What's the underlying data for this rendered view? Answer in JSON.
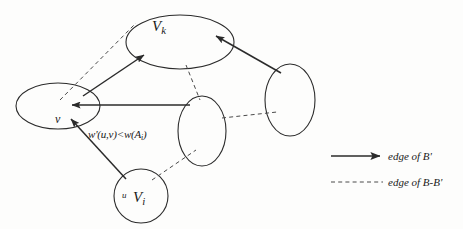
{
  "figure": {
    "nodes": [
      {
        "id": "vk",
        "label_main": "V",
        "label_sub": "k",
        "shape": "ellipse",
        "cx": 180,
        "cy": 42,
        "rx": 54,
        "ry": 27,
        "orientation": "horizontal"
      },
      {
        "id": "v",
        "label_main": "v",
        "label_sub": "",
        "shape": "ellipse",
        "cx": 58,
        "cy": 106,
        "rx": 42,
        "ry": 23,
        "orientation": "horizontal"
      },
      {
        "id": "mid",
        "label_main": "",
        "label_sub": "",
        "shape": "ellipse",
        "cx": 202,
        "cy": 131,
        "rx": 24,
        "ry": 35,
        "orientation": "vertical"
      },
      {
        "id": "right",
        "label_main": "",
        "label_sub": "",
        "shape": "ellipse",
        "cx": 290,
        "cy": 100,
        "rx": 25,
        "ry": 36,
        "orientation": "vertical"
      },
      {
        "id": "vi",
        "label_main": "V",
        "label_sub": "i",
        "shape": "circle",
        "cx": 141,
        "cy": 196,
        "rx": 27,
        "ry": 27,
        "orientation": "circle"
      }
    ],
    "node_labels": {
      "vk": "V",
      "vk_sub": "k",
      "v": "v",
      "vi": "V",
      "vi_sub": "i",
      "u": "u"
    },
    "edges_solid": [
      {
        "name": "v-to-vk",
        "from": "v",
        "to": "vk",
        "x1": 83,
        "y1": 96,
        "x2": 144,
        "y2": 55
      },
      {
        "name": "mid-to-v",
        "from": "mid",
        "to": "v",
        "x1": 190,
        "y1": 105,
        "x2": 72,
        "y2": 105
      },
      {
        "name": "vi-to-v",
        "from": "vi",
        "to": "v",
        "x1": 126,
        "y1": 179,
        "x2": 71,
        "y2": 119
      },
      {
        "name": "right-to-vk",
        "from": "right",
        "to": "vk",
        "x1": 281,
        "y1": 73,
        "x2": 216,
        "y2": 36
      }
    ],
    "edges_dashed": [
      {
        "name": "v-to-vk-dashed",
        "from": "v",
        "to": "vk",
        "x1": 60,
        "y1": 100,
        "x2": 136,
        "y2": 23
      },
      {
        "name": "vk-to-mid-dashed",
        "from": "vk",
        "to": "mid",
        "x1": 186,
        "y1": 65,
        "x2": 200,
        "y2": 100
      },
      {
        "name": "mid-to-right-dashed",
        "from": "mid",
        "to": "right",
        "x1": 222,
        "y1": 118,
        "x2": 277,
        "y2": 112
      },
      {
        "name": "vi-to-mid-dashed",
        "from": "vi",
        "to": "mid",
        "x1": 152,
        "y1": 180,
        "x2": 196,
        "y2": 150
      }
    ],
    "annotation": "w'(u,v)<w(A",
    "annotation_sub": "i",
    "annotation_tail": ")",
    "colors": {
      "stroke": "#2b2b2b",
      "text": "#1a1a1a",
      "background": "#fdfdfc"
    }
  },
  "legend": {
    "items": [
      {
        "style": "solid",
        "label": "edge of B'"
      },
      {
        "style": "dashed",
        "label": "edge of B-B'"
      }
    ]
  }
}
